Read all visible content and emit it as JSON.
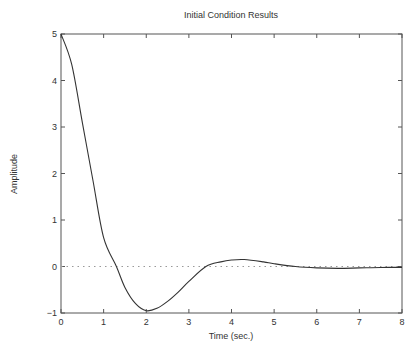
{
  "chart_data": {
    "type": "line",
    "title": "Initial Condition Results",
    "xlabel": "Time (sec.)",
    "ylabel": "Amplitude",
    "xlim": [
      0,
      8
    ],
    "ylim": [
      -1,
      5
    ],
    "xticks": [
      0,
      1,
      2,
      3,
      4,
      5,
      6,
      7,
      8
    ],
    "yticks": [
      -1,
      0,
      1,
      2,
      3,
      4,
      5
    ],
    "grid": false,
    "legend": null,
    "reference_line": {
      "y": 0,
      "style": "dotted"
    },
    "series": [
      {
        "name": "response",
        "x": [
          0,
          0.25,
          0.5,
          0.75,
          1.0,
          1.3,
          1.5,
          1.75,
          2.0,
          2.25,
          2.5,
          2.75,
          3.0,
          3.4,
          3.75,
          4.0,
          4.3,
          4.75,
          5.0,
          5.5,
          6.0,
          6.5,
          7.0,
          7.5,
          8.0
        ],
        "y": [
          5.0,
          4.35,
          3.1,
          1.85,
          0.62,
          0.0,
          -0.45,
          -0.8,
          -0.95,
          -0.9,
          -0.75,
          -0.55,
          -0.32,
          0.0,
          0.1,
          0.14,
          0.15,
          0.1,
          0.06,
          0.0,
          -0.03,
          -0.04,
          -0.03,
          -0.02,
          -0.02
        ]
      }
    ]
  },
  "colors": {
    "line": "#333333",
    "axes": "#555555",
    "zero_line": "#999999",
    "background": "#ffffff"
  }
}
